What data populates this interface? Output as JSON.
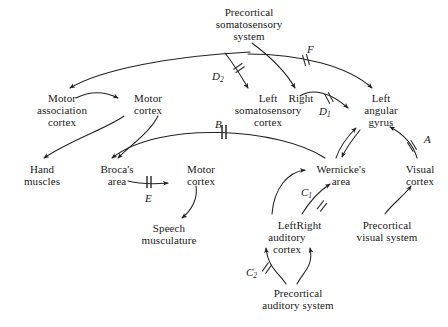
{
  "figure": {
    "type": "neuroanatomical-flow-diagram",
    "background_color": "#ffffff",
    "line_color": "#222222",
    "text_color": "#1a1a1a"
  },
  "nodes": [
    {
      "id": "precortical-somatosensory-system",
      "lines": [
        "Precortical",
        "somatosensory",
        "system"
      ],
      "x": 193,
      "y": 8,
      "w": 112
    },
    {
      "id": "motor-association-cortex",
      "lines": [
        "Motor",
        "association",
        "cortex"
      ],
      "x": 18,
      "y": 92,
      "w": 90
    },
    {
      "id": "motor-cortex-upper",
      "lines": [
        "Motor",
        "cortex"
      ],
      "x": 123,
      "y": 92,
      "w": 52
    },
    {
      "id": "left-somatosensory-cortex",
      "lines": [
        "Left",
        "somatosensory",
        "cortex"
      ],
      "x": 228,
      "y": 92,
      "w": 80
    },
    {
      "id": "right-somatosensory",
      "lines": [
        "Right"
      ],
      "x": 283,
      "y": 92,
      "w": 34
    },
    {
      "id": "left-angular-gyrus",
      "lines": [
        "Left",
        "angular",
        "gyrus"
      ],
      "x": 357,
      "y": 92,
      "w": 48
    },
    {
      "id": "hand-muscles",
      "lines": [
        "Hand",
        "muscles"
      ],
      "x": 16,
      "y": 163,
      "w": 52
    },
    {
      "id": "brocas-area",
      "lines": [
        "Broca's",
        "area"
      ],
      "x": 95,
      "y": 163,
      "w": 44
    },
    {
      "id": "motor-cortex-lower",
      "lines": [
        "Motor",
        "cortex"
      ],
      "x": 176,
      "y": 163,
      "w": 52
    },
    {
      "id": "wernickes-area",
      "lines": [
        "Wernicke's",
        "area"
      ],
      "x": 309,
      "y": 163,
      "w": 62
    },
    {
      "id": "visual-cortex",
      "lines": [
        "Visual",
        "cortex"
      ],
      "x": 400,
      "y": 163,
      "w": 42
    },
    {
      "id": "speech-musculature",
      "lines": [
        "Speech",
        "musculature"
      ],
      "x": 131,
      "y": 222,
      "w": 76
    },
    {
      "id": "left-auditory-cortex",
      "lines": [
        "Left",
        "auditory",
        "cortex"
      ],
      "x": 258,
      "y": 219,
      "w": 58
    },
    {
      "id": "right-auditory",
      "lines": [
        "Right"
      ],
      "x": 291,
      "y": 219,
      "w": 34
    },
    {
      "id": "precortical-visual-system",
      "lines": [
        "Precortical",
        "visual system"
      ],
      "x": 347,
      "y": 219,
      "w": 80
    },
    {
      "id": "precortical-auditory-system",
      "lines": [
        "Precortical",
        "auditory system"
      ],
      "x": 252,
      "y": 287,
      "w": 92
    }
  ],
  "node_text": {
    "precortical_somatosensory_system": {
      "l1": "Precortical",
      "l2": "somatosensory",
      "l3": "system"
    },
    "motor_association_cortex": {
      "l1": "Motor",
      "l2": "association",
      "l3": "cortex"
    },
    "motor_cortex_upper": {
      "l1": "Motor",
      "l2": "cortex"
    },
    "left_somatosensory_cortex": {
      "l1": "Left",
      "l2": "somatosensory",
      "l3": "cortex"
    },
    "right_somatosensory": {
      "l1": "Right"
    },
    "left_angular_gyrus": {
      "l1": "Left",
      "l2": "angular",
      "l3": "gyrus"
    },
    "hand_muscles": {
      "l1": "Hand",
      "l2": "muscles"
    },
    "brocas_area": {
      "l1": "Broca's",
      "l2": "area"
    },
    "motor_cortex_lower": {
      "l1": "Motor",
      "l2": "cortex"
    },
    "wernickes_area": {
      "l1": "Wernicke's",
      "l2": "area"
    },
    "visual_cortex": {
      "l1": "Visual",
      "l2": "cortex"
    },
    "speech_musculature": {
      "l1": "Speech",
      "l2": "musculature"
    },
    "left_auditory_cortex": {
      "l1": "Left",
      "l2": "auditory",
      "l3": "cortex"
    },
    "right_auditory": {
      "l1": "Right"
    },
    "precortical_visual_system": {
      "l1": "Precortical",
      "l2": "visual system"
    },
    "precortical_auditory_system": {
      "l1": "Precortical",
      "l2": "auditory system"
    }
  },
  "edge_labels": {
    "A": {
      "text": "A",
      "sub": "",
      "x": 424,
      "y": 140
    },
    "B": {
      "text": "B",
      "sub": "",
      "x": 215,
      "y": 118
    },
    "C1": {
      "text": "C",
      "sub": "1",
      "x": 304,
      "y": 187
    },
    "C2": {
      "text": "C",
      "sub": "2",
      "x": 249,
      "y": 267
    },
    "D1": {
      "text": "D",
      "sub": "1",
      "x": 322,
      "y": 105
    },
    "D2": {
      "text": "D",
      "sub": "2",
      "x": 215,
      "y": 70
    },
    "E": {
      "text": "E",
      "sub": "",
      "x": 146,
      "y": 193
    },
    "F": {
      "text": "F",
      "sub": "",
      "x": 309,
      "y": 44
    }
  },
  "edges": [
    {
      "id": "precortical-somatosensory-to-motor-association-cortex",
      "cut": false
    },
    {
      "id": "motor-association-cortex-to-motor-cortex",
      "cut": false
    },
    {
      "id": "motor-cortex-to-hand-muscles",
      "cut": false
    },
    {
      "id": "motor-cortex-to-brocas-area",
      "cut": false
    },
    {
      "id": "precortical-somatosensory-to-left-somatosensory-cortex",
      "cut": true,
      "label": "D2"
    },
    {
      "id": "precortical-somatosensory-to-right-somatosensory",
      "cut": false
    },
    {
      "id": "precortical-somatosensory-to-left-angular-gyrus",
      "cut": true,
      "label": "F"
    },
    {
      "id": "right-somatosensory-to-left-angular-gyrus",
      "cut": true,
      "label": "D1"
    },
    {
      "id": "wernickes-area-to-brocas-area",
      "cut": true,
      "label": "B"
    },
    {
      "id": "brocas-area-to-motor-cortex-lower",
      "cut": true,
      "label": "E"
    },
    {
      "id": "motor-cortex-lower-to-speech-musculature",
      "cut": false
    },
    {
      "id": "left-angular-gyrus-to-wernickes-area",
      "cut": false
    },
    {
      "id": "wernickes-area-to-left-angular-gyrus",
      "cut": false
    },
    {
      "id": "visual-cortex-to-left-angular-gyrus",
      "cut": true,
      "label": "A"
    },
    {
      "id": "precortical-visual-system-to-visual-cortex",
      "cut": false
    },
    {
      "id": "left-auditory-cortex-to-wernickes-area",
      "cut": false
    },
    {
      "id": "right-auditory-to-wernickes-area",
      "cut": true,
      "label": "C1"
    },
    {
      "id": "precortical-auditory-system-to-left-auditory-cortex",
      "cut": true,
      "label": "C2"
    },
    {
      "id": "precortical-auditory-system-to-right-auditory",
      "cut": false
    }
  ]
}
